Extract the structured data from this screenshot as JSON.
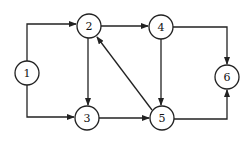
{
  "diagram": {
    "type": "directed-graph",
    "nodes": [
      {
        "id": "1",
        "label": "1",
        "x": 27,
        "y": 73
      },
      {
        "id": "2",
        "label": "2",
        "x": 89,
        "y": 26
      },
      {
        "id": "3",
        "label": "3",
        "x": 87,
        "y": 118
      },
      {
        "id": "4",
        "label": "4",
        "x": 161,
        "y": 27
      },
      {
        "id": "5",
        "label": "5",
        "x": 162,
        "y": 118
      },
      {
        "id": "6",
        "label": "6",
        "x": 227,
        "y": 77
      }
    ],
    "edges": [
      {
        "from": "1",
        "to": "2"
      },
      {
        "from": "1",
        "to": "3"
      },
      {
        "from": "2",
        "to": "4"
      },
      {
        "from": "2",
        "to": "3"
      },
      {
        "from": "3",
        "to": "5"
      },
      {
        "from": "4",
        "to": "5"
      },
      {
        "from": "5",
        "to": "2"
      },
      {
        "from": "4",
        "to": "6"
      },
      {
        "from": "5",
        "to": "6"
      }
    ]
  }
}
